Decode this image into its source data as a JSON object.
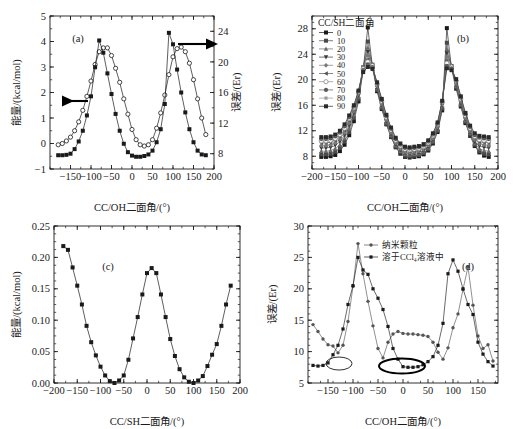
{
  "figure": {
    "panels": [
      "a",
      "b",
      "c",
      "d"
    ]
  },
  "chart_data": [
    {
      "type": "line",
      "panel_label": "(a)",
      "title": "",
      "xlabel": "CC/OH二面角/(°)",
      "ylabel": "能量/(kcal/mol)",
      "y2label": "误差/(Er)",
      "xlim": [
        -200,
        200
      ],
      "ylim": [
        -1,
        5
      ],
      "y2lim": [
        6,
        26
      ],
      "xticks": [
        -150,
        -100,
        -50,
        0,
        50,
        100,
        150,
        200
      ],
      "yticks": [
        -1,
        0,
        1,
        2,
        3,
        4,
        5
      ],
      "y2ticks": [
        8,
        12,
        16,
        20,
        24
      ],
      "grid": false,
      "legend": "none",
      "annotations": [
        "left-arrow-to-energy-axis",
        "right-arrow-to-error-axis"
      ],
      "series": [
        {
          "name": "能量",
          "marker": "open-circle",
          "axis": "left",
          "x": [
            -180,
            -170,
            -160,
            -150,
            -140,
            -130,
            -120,
            -110,
            -100,
            -90,
            -80,
            -70,
            -60,
            -50,
            -40,
            -30,
            -20,
            -10,
            0,
            10,
            20,
            30,
            40,
            50,
            60,
            70,
            80,
            90,
            100,
            110,
            120,
            130,
            140,
            150,
            160,
            170,
            180
          ],
          "values": [
            -0.05,
            0.0,
            0.1,
            0.25,
            0.5,
            0.85,
            1.3,
            1.85,
            2.45,
            3.1,
            3.6,
            3.75,
            3.75,
            3.45,
            2.95,
            2.4,
            1.75,
            1.15,
            0.55,
            0.15,
            -0.05,
            -0.1,
            -0.05,
            0.15,
            0.6,
            1.2,
            1.9,
            2.7,
            3.4,
            3.72,
            3.78,
            3.6,
            3.15,
            2.5,
            1.75,
            1.0,
            0.35
          ]
        },
        {
          "name": "误差",
          "marker": "filled-square",
          "axis": "right",
          "x": [
            -180,
            -170,
            -160,
            -150,
            -140,
            -130,
            -120,
            -110,
            -100,
            -90,
            -80,
            -70,
            -60,
            -50,
            -40,
            -30,
            -20,
            -10,
            0,
            10,
            20,
            30,
            40,
            50,
            60,
            70,
            80,
            90,
            100,
            110,
            120,
            130,
            140,
            150,
            160,
            170,
            180
          ],
          "values": [
            7.8,
            7.8,
            7.85,
            8.0,
            8.6,
            9.6,
            11.0,
            13.0,
            15.5,
            19.3,
            22.8,
            21.2,
            18.5,
            15.8,
            13.2,
            11.0,
            9.3,
            8.2,
            7.75,
            7.6,
            7.6,
            7.7,
            7.9,
            8.4,
            9.5,
            11.2,
            14.5,
            23.8,
            22.3,
            19.0,
            16.0,
            13.4,
            11.2,
            9.5,
            8.4,
            7.9,
            7.8
          ]
        }
      ]
    },
    {
      "type": "line",
      "panel_label": "(b)",
      "title": "",
      "xlabel": "CC/OH二面角/(°)",
      "ylabel": "误差/(Er)",
      "xlim": [
        -200,
        200
      ],
      "ylim": [
        6,
        30
      ],
      "xticks": [
        -200,
        -150,
        -100,
        -50,
        0,
        50,
        100,
        150,
        200
      ],
      "yticks": [
        8,
        12,
        16,
        20,
        24,
        28
      ],
      "grid": false,
      "legend_title": "CC/SH二面角",
      "legend_position": "upper-left",
      "legend": [
        "0",
        "10",
        "20",
        "30",
        "40",
        "50",
        "60",
        "70",
        "80",
        "90"
      ],
      "x": [
        -180,
        -170,
        -160,
        -150,
        -140,
        -130,
        -120,
        -110,
        -100,
        -90,
        -80,
        -70,
        -60,
        -50,
        -40,
        -30,
        -20,
        -10,
        0,
        10,
        20,
        30,
        40,
        50,
        60,
        70,
        80,
        90,
        100,
        110,
        120,
        130,
        140,
        150,
        160,
        170,
        180
      ],
      "series": [
        {
          "name": "0",
          "marker": "filled-square",
          "values": [
            7.9,
            7.9,
            8.0,
            8.2,
            8.8,
            9.8,
            11.3,
            13.5,
            16.6,
            21.5,
            28.2,
            22.0,
            18.2,
            15.4,
            13.0,
            11.0,
            9.4,
            8.4,
            7.9,
            7.8,
            7.9,
            8.0,
            8.3,
            8.9,
            10.0,
            11.8,
            15.2,
            28.1,
            21.8,
            18.6,
            15.8,
            13.2,
            11.2,
            9.6,
            8.6,
            8.1,
            7.9
          ]
        },
        {
          "name": "10",
          "marker": "filled-square",
          "values": [
            8.3,
            8.3,
            8.4,
            8.7,
            9.3,
            10.3,
            11.8,
            14.0,
            17.0,
            21.8,
            26.0,
            22.2,
            18.4,
            15.6,
            13.1,
            11.1,
            9.5,
            8.6,
            8.1,
            8.0,
            8.1,
            8.2,
            8.5,
            9.1,
            10.2,
            12.0,
            15.5,
            25.8,
            22.0,
            18.8,
            16.0,
            13.4,
            11.4,
            9.8,
            8.8,
            8.4,
            8.3
          ]
        },
        {
          "name": "20",
          "marker": "filled-triangle",
          "values": [
            8.8,
            8.8,
            8.9,
            9.2,
            9.8,
            10.8,
            12.3,
            14.4,
            17.3,
            21.9,
            25.0,
            22.3,
            18.6,
            15.8,
            13.3,
            11.3,
            9.7,
            8.8,
            8.3,
            8.2,
            8.3,
            8.4,
            8.7,
            9.3,
            10.4,
            12.2,
            15.8,
            24.8,
            22.1,
            19.0,
            16.2,
            13.6,
            11.6,
            10.0,
            9.2,
            8.9,
            8.8
          ]
        },
        {
          "name": "30",
          "marker": "filled-down-triangle",
          "values": [
            9.3,
            9.3,
            9.4,
            9.7,
            10.3,
            11.3,
            12.8,
            14.8,
            17.6,
            22.0,
            24.4,
            22.4,
            18.8,
            16.0,
            13.5,
            11.5,
            9.9,
            9.0,
            8.5,
            8.4,
            8.5,
            8.6,
            8.9,
            9.5,
            10.6,
            12.4,
            16.0,
            24.2,
            22.2,
            19.2,
            16.4,
            13.8,
            11.8,
            10.3,
            9.6,
            9.4,
            9.3
          ]
        },
        {
          "name": "40",
          "marker": "filled-diamond",
          "values": [
            9.7,
            9.7,
            9.8,
            10.1,
            10.7,
            11.7,
            13.2,
            15.1,
            17.8,
            22.0,
            23.8,
            22.4,
            19.0,
            16.2,
            13.7,
            11.7,
            10.1,
            9.2,
            8.7,
            8.6,
            8.7,
            8.8,
            9.1,
            9.7,
            10.8,
            12.6,
            16.2,
            23.6,
            22.2,
            19.4,
            16.6,
            14.0,
            12.0,
            10.6,
            10.0,
            9.8,
            9.7
          ]
        },
        {
          "name": "50",
          "marker": "left-triangle",
          "values": [
            10.1,
            10.1,
            10.2,
            10.5,
            11.1,
            12.1,
            13.6,
            15.4,
            18.0,
            21.9,
            23.2,
            22.3,
            19.2,
            16.4,
            13.9,
            11.9,
            10.3,
            9.4,
            8.9,
            8.8,
            8.9,
            9.0,
            9.3,
            9.9,
            11.0,
            12.8,
            16.4,
            23.0,
            22.1,
            19.6,
            16.8,
            14.2,
            12.2,
            10.9,
            10.3,
            10.2,
            10.1
          ]
        },
        {
          "name": "60",
          "marker": "open-circle",
          "values": [
            10.4,
            10.4,
            10.5,
            10.8,
            11.4,
            12.4,
            13.9,
            15.6,
            18.1,
            21.7,
            22.8,
            22.2,
            19.3,
            16.6,
            14.1,
            12.1,
            10.5,
            9.6,
            9.1,
            9.0,
            9.1,
            9.2,
            9.5,
            10.1,
            11.2,
            13.0,
            16.5,
            22.6,
            22.0,
            19.8,
            17.0,
            14.4,
            12.4,
            11.1,
            10.6,
            10.5,
            10.4
          ]
        },
        {
          "name": "70",
          "marker": "filled-circle",
          "values": [
            10.7,
            10.7,
            10.8,
            11.1,
            11.7,
            12.7,
            14.1,
            15.8,
            18.2,
            21.5,
            22.4,
            22.0,
            19.4,
            16.8,
            14.3,
            12.3,
            10.7,
            9.8,
            9.3,
            9.2,
            9.3,
            9.4,
            9.7,
            10.3,
            11.4,
            13.1,
            16.6,
            22.2,
            21.8,
            19.9,
            17.2,
            14.6,
            12.6,
            11.3,
            10.9,
            10.8,
            10.7
          ]
        },
        {
          "name": "80",
          "marker": "filled-square-sm",
          "values": [
            10.9,
            10.9,
            11.0,
            11.3,
            11.9,
            12.9,
            14.3,
            15.9,
            18.2,
            21.3,
            22.1,
            21.8,
            19.5,
            16.9,
            14.4,
            12.4,
            10.8,
            9.9,
            9.4,
            9.3,
            9.4,
            9.5,
            9.8,
            10.4,
            11.5,
            13.2,
            16.6,
            21.9,
            21.6,
            20.0,
            17.3,
            14.7,
            12.7,
            11.5,
            11.1,
            11.0,
            10.9
          ]
        },
        {
          "name": "90",
          "marker": "filled-square",
          "values": [
            11.0,
            11.0,
            11.1,
            11.4,
            12.0,
            13.0,
            14.4,
            16.0,
            18.3,
            21.2,
            22.0,
            21.7,
            19.6,
            17.0,
            14.5,
            12.5,
            10.9,
            10.0,
            9.5,
            9.4,
            9.5,
            9.6,
            9.9,
            10.5,
            11.6,
            13.3,
            16.7,
            21.8,
            21.5,
            20.1,
            17.4,
            14.8,
            12.8,
            11.6,
            11.2,
            11.1,
            11.0
          ]
        }
      ]
    },
    {
      "type": "line",
      "panel_label": "(c)",
      "title": "",
      "xlabel": "CC/SH二面角/(°)",
      "ylabel": "能量/(kcal/mol)",
      "xlim": [
        -200,
        200
      ],
      "ylim": [
        0.0,
        0.25
      ],
      "xticks": [
        -200,
        -150,
        -100,
        -50,
        0,
        50,
        100,
        150,
        200
      ],
      "yticks": [
        0.0,
        0.05,
        0.1,
        0.15,
        0.2,
        0.25
      ],
      "grid": false,
      "legend": "none",
      "series": [
        {
          "name": "能量",
          "marker": "filled-square",
          "x": [
            -180,
            -170,
            -160,
            -150,
            -140,
            -130,
            -120,
            -110,
            -100,
            -90,
            -80,
            -70,
            -60,
            -50,
            -40,
            -30,
            -20,
            -10,
            0,
            10,
            20,
            30,
            40,
            50,
            60,
            70,
            80,
            90,
            100,
            110,
            120,
            130,
            140,
            150,
            160,
            170,
            180
          ],
          "values": [
            0.218,
            0.212,
            0.184,
            0.155,
            0.125,
            0.091,
            0.065,
            0.044,
            0.026,
            0.012,
            0.003,
            0.0,
            0.004,
            0.012,
            0.037,
            0.071,
            0.105,
            0.141,
            0.175,
            0.183,
            0.175,
            0.141,
            0.105,
            0.07,
            0.043,
            0.022,
            0.009,
            0.002,
            0.0,
            0.004,
            0.011,
            0.027,
            0.045,
            0.062,
            0.091,
            0.125,
            0.155
          ]
        }
      ]
    },
    {
      "type": "line",
      "panel_label": "(d)",
      "title": "",
      "xlabel": "CC/OH二面角/(°)",
      "ylabel": "误差/(Er)",
      "xlim": [
        -190,
        190
      ],
      "ylim": [
        5,
        30
      ],
      "xticks": [
        -150,
        -100,
        -50,
        0,
        50,
        100,
        150
      ],
      "yticks": [
        5,
        10,
        15,
        20,
        25,
        30
      ],
      "grid": false,
      "legend_position": "upper-center",
      "annotations": [
        "small-ellipse-near--130",
        "bold-ellipse-near-0"
      ],
      "x": [
        -180,
        -170,
        -160,
        -150,
        -140,
        -130,
        -120,
        -110,
        -100,
        -90,
        -80,
        -70,
        -60,
        -50,
        -40,
        -30,
        -20,
        -10,
        0,
        10,
        20,
        30,
        40,
        50,
        60,
        70,
        80,
        90,
        100,
        110,
        120,
        130,
        140,
        150,
        160,
        170,
        180
      ],
      "series": [
        {
          "name": "纳米颗粒",
          "marker": "filled-circle-sm",
          "values": [
            14.3,
            13.2,
            12.0,
            11.1,
            10.9,
            9.8,
            11.0,
            14.8,
            20.4,
            27.2,
            22.4,
            18.0,
            14.1,
            10.5,
            9.0,
            11.5,
            12.8,
            13.2,
            12.9,
            12.8,
            12.8,
            12.7,
            12.6,
            12.4,
            11.5,
            9.9,
            8.8,
            10.6,
            13.8,
            16.0,
            19.9,
            23.5,
            17.4,
            12.5,
            10.5,
            11.1,
            8.5
          ]
        },
        {
          "name": "溶于CCl₄溶液中",
          "marker": "filled-square-sm",
          "values": [
            7.8,
            7.7,
            7.8,
            8.2,
            9.5,
            11.0,
            13.6,
            17.5,
            20.5,
            25.0,
            23.0,
            22.3,
            20.0,
            18.5,
            16.7,
            14.0,
            10.5,
            8.8,
            7.6,
            7.5,
            7.5,
            7.6,
            7.9,
            8.4,
            9.2,
            11.0,
            14.5,
            22.4,
            24.6,
            22.8,
            20.0,
            17.5,
            15.9,
            11.5,
            9.6,
            8.4,
            7.7
          ]
        }
      ]
    }
  ]
}
